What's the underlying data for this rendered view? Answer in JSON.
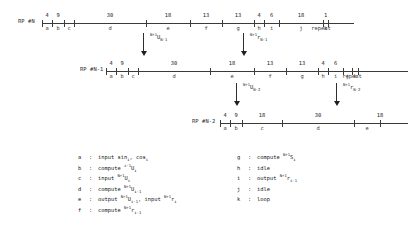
{
  "diagram": {
    "title_text": "",
    "repeat_label": "repeat",
    "rows": [
      {
        "name": "RP #N",
        "label": "RP #N",
        "x": 18,
        "y": 8,
        "label_x": 0,
        "axis_x": 24,
        "axis_width": 312,
        "segments": [
          {
            "key": "a",
            "duration": "4",
            "tick": 0,
            "end": 10
          },
          {
            "key": "b",
            "duration": "9",
            "tick": 10,
            "end": 22
          },
          {
            "key": "c",
            "duration": "",
            "tick": 22,
            "end": 32
          },
          {
            "key": "d",
            "duration": "30",
            "tick": 32,
            "end": 104
          },
          {
            "key": "e",
            "duration": "18",
            "tick": 104,
            "end": 148
          },
          {
            "key": "f",
            "duration": "13",
            "tick": 148,
            "end": 180
          },
          {
            "key": "g",
            "duration": "13",
            "tick": 180,
            "end": 212
          },
          {
            "key": "h",
            "duration": "4",
            "tick": 212,
            "end": 222
          },
          {
            "key": "i",
            "duration": "6",
            "tick": 222,
            "end": 237
          },
          {
            "key": "j",
            "duration": "18",
            "tick": 237,
            "end": 281
          },
          {
            "key": "k",
            "duration": "1",
            "tick": 281,
            "end": 286
          }
        ],
        "repeat_x": 303
      },
      {
        "name": "RP #N-1",
        "label": "RP #N-1",
        "x": 80,
        "y": 56,
        "label_x": 0,
        "axis_x": 26,
        "axis_width": 302,
        "segments": [
          {
            "key": "a",
            "duration": "4",
            "tick": 0,
            "end": 10
          },
          {
            "key": "b",
            "duration": "9",
            "tick": 10,
            "end": 22
          },
          {
            "key": "c",
            "duration": "",
            "tick": 22,
            "end": 32
          },
          {
            "key": "d",
            "duration": "30",
            "tick": 32,
            "end": 104
          },
          {
            "key": "e",
            "duration": "18",
            "tick": 104,
            "end": 148
          },
          {
            "key": "f",
            "duration": "13",
            "tick": 148,
            "end": 180
          },
          {
            "key": "g",
            "duration": "13",
            "tick": 180,
            "end": 212
          },
          {
            "key": "h",
            "duration": "4",
            "tick": 212,
            "end": 222
          },
          {
            "key": "i",
            "duration": "6",
            "tick": 222,
            "end": 237
          },
          {
            "key": "j",
            "duration": "",
            "tick": 237,
            "end": 246
          },
          {
            "key": "k",
            "duration": "",
            "tick": 246,
            "end": 252
          }
        ],
        "repeat_x": 272
      },
      {
        "name": "RP #N-2",
        "label": "RP #N-2",
        "x": 192,
        "y": 108,
        "label_x": 0,
        "axis_x": 28,
        "axis_width": 188,
        "segments": [
          {
            "key": "a",
            "duration": "4",
            "tick": 0,
            "end": 10
          },
          {
            "key": "b",
            "duration": "9",
            "tick": 10,
            "end": 22
          },
          {
            "key": "c",
            "duration": "18",
            "tick": 22,
            "end": 62
          },
          {
            "key": "d",
            "duration": "30",
            "tick": 62,
            "end": 134
          },
          {
            "key": "e",
            "duration": "",
            "tick": 134,
            "end": 160
          }
        ],
        "repeat_x": -1
      }
    ],
    "row3_extra_tick_label": "18",
    "arrows": [
      {
        "name": "arrow-u-n-1",
        "x": 143,
        "y": 33,
        "lab_x": 150,
        "lab_y": 35,
        "sup": "N+1",
        "base": "U",
        "sub": "N-1"
      },
      {
        "name": "arrow-r-n-1",
        "x": 243,
        "y": 33,
        "lab_x": 250,
        "lab_y": 35,
        "sup": "N+1",
        "base": "r",
        "sub": "N-1"
      },
      {
        "name": "arrow-u-n-2",
        "x": 236,
        "y": 83,
        "lab_x": 243,
        "lab_y": 85,
        "sup": "N+1",
        "base": "U",
        "sub": "N-2"
      },
      {
        "name": "arrow-r-n-2",
        "x": 336,
        "y": 83,
        "lab_x": 343,
        "lab_y": 85,
        "sup": "N+1",
        "base": "r",
        "sub": "N-2"
      }
    ]
  },
  "legend": {
    "left_x": 78,
    "left_y": 155,
    "right_x": 237,
    "right_y": 155,
    "line_height": 10.5,
    "separator": ":",
    "left_entries": [
      {
        "key": "a",
        "parts": [
          {
            "t": "input sin"
          },
          {
            "sub": "i"
          },
          {
            "t": ", cos"
          },
          {
            "sub": "i"
          }
        ]
      },
      {
        "key": "b",
        "parts": [
          {
            "t": "compute "
          },
          {
            "sup": "i-1"
          },
          {
            "t": "U"
          },
          {
            "sub": "i"
          }
        ]
      },
      {
        "key": "c",
        "parts": [
          {
            "t": "input "
          },
          {
            "sup": "N+1"
          },
          {
            "t": "U"
          },
          {
            "sub": "i"
          }
        ]
      },
      {
        "key": "d",
        "parts": [
          {
            "t": "compute "
          },
          {
            "sup": "N+1"
          },
          {
            "t": "U"
          },
          {
            "sub": "i-1"
          }
        ]
      },
      {
        "key": "e",
        "parts": [
          {
            "t": "output "
          },
          {
            "sup": "N+1"
          },
          {
            "t": "U"
          },
          {
            "sub": "i-1"
          },
          {
            "t": ", input "
          },
          {
            "sup": "N+1"
          },
          {
            "t": "r"
          },
          {
            "sub": "i"
          }
        ]
      },
      {
        "key": "f",
        "parts": [
          {
            "t": "compute "
          },
          {
            "sup": "N+1"
          },
          {
            "t": "r"
          },
          {
            "sub": "i-1"
          }
        ]
      }
    ],
    "right_entries": [
      {
        "key": "g",
        "parts": [
          {
            "t": "compute "
          },
          {
            "sup": "N+1"
          },
          {
            "t": "S"
          },
          {
            "sub": "i"
          }
        ]
      },
      {
        "key": "h",
        "parts": [
          {
            "t": "idle"
          }
        ]
      },
      {
        "key": "i",
        "parts": [
          {
            "t": "output "
          },
          {
            "sup": "N+1"
          },
          {
            "t": "r"
          },
          {
            "sub": "i-1"
          }
        ]
      },
      {
        "key": "j",
        "parts": [
          {
            "t": "idle"
          }
        ]
      },
      {
        "key": "k",
        "parts": [
          {
            "t": "loop"
          }
        ]
      }
    ]
  },
  "colors": {
    "line": "#3a3a3a",
    "text": "#1c1c1c",
    "background": "#ffffff"
  }
}
